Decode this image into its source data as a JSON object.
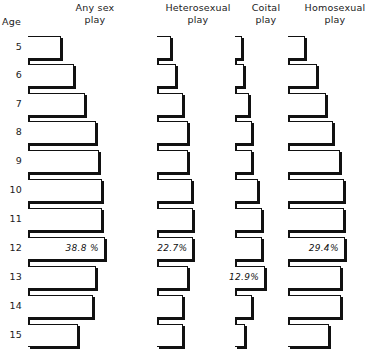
{
  "axis": {
    "caption": "Age",
    "tick_labels": [
      "5",
      "6",
      "7",
      "8",
      "9",
      "10",
      "11",
      "12",
      "13",
      "14",
      "15"
    ]
  },
  "columns": [
    {
      "title": "Any sex\nplay"
    },
    {
      "title": "Heterosexual\nplay"
    },
    {
      "title": "Coital\nplay"
    },
    {
      "title": "Homosexual\nplay"
    }
  ],
  "labels": {
    "any_sex_peak": "38.8 %",
    "heterosexual_peak": "22.7%",
    "coital_peak": "12.9%",
    "homosexual_peak": "29.4%"
  },
  "colors": {
    "ink": "#111111",
    "paper": "#ffffff"
  },
  "chart_data": {
    "type": "bar",
    "orientation": "horizontal",
    "title": "",
    "subtitle": "",
    "xlabel": "Percent",
    "ylabel": "Age",
    "grid": false,
    "legend": "none",
    "categories": [
      "5",
      "6",
      "7",
      "8",
      "9",
      "10",
      "11",
      "12",
      "13",
      "14",
      "15"
    ],
    "xlim": [
      0,
      40
    ],
    "series": [
      {
        "name": "Any sex play",
        "values": [
          16.5,
          23.0,
          29.0,
          34.5,
          36.0,
          37.5,
          37.5,
          38.8,
          34.5,
          33.0,
          25.5
        ]
      },
      {
        "name": "Heterosexual play",
        "values": [
          8.5,
          12.0,
          16.0,
          19.5,
          19.5,
          22.0,
          22.5,
          22.7,
          19.5,
          16.5,
          16.5
        ]
      },
      {
        "name": "Coital play",
        "values": [
          3.0,
          4.0,
          6.0,
          7.5,
          7.5,
          10.0,
          11.5,
          11.5,
          12.9,
          7.5,
          4.5
        ]
      },
      {
        "name": "Homosexual play",
        "values": [
          9.0,
          15.0,
          19.5,
          23.5,
          27.0,
          29.0,
          29.0,
          29.4,
          27.5,
          27.5,
          21.0
        ]
      }
    ],
    "annotations": [
      {
        "series": "Any sex play",
        "category": "12",
        "text": "38.8 %"
      },
      {
        "series": "Heterosexual play",
        "category": "12",
        "text": "22.7%"
      },
      {
        "series": "Coital play",
        "category": "13",
        "text": "12.9%"
      },
      {
        "series": "Homosexual play",
        "category": "12",
        "text": "29.4%"
      }
    ]
  },
  "layout": {
    "row_top": [
      36,
      64,
      93,
      121,
      150,
      179,
      208,
      237,
      266,
      295,
      324
    ],
    "row_height": 23,
    "group_left": [
      28,
      157,
      235,
      288
    ],
    "px_per_unit": [
      1.98,
      1.6,
      2.33,
      1.93
    ]
  }
}
